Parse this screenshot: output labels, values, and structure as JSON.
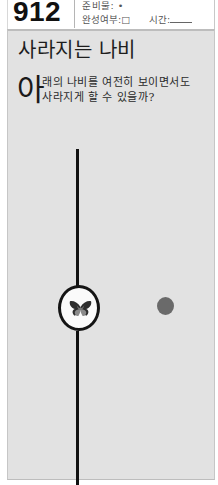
{
  "header": {
    "puzzle_number": "912",
    "prep_label": "준비물: •",
    "completion_label": "완성여부:□",
    "time_label": "시간:",
    "top_cut_text": "···"
  },
  "content": {
    "title": "사라지는 나비",
    "dropcap": "아",
    "description_line1": "래의 나비를 여전히 보이면서도",
    "description_line2": "사라지게 할 수 있을까?"
  },
  "figure": {
    "line_color": "#111111",
    "circle_fill": "#fafafa",
    "dot_color": "#6a6a6a",
    "background": "#e2e2e2",
    "icons": [
      "butterfly-icon",
      "dot-icon"
    ]
  }
}
